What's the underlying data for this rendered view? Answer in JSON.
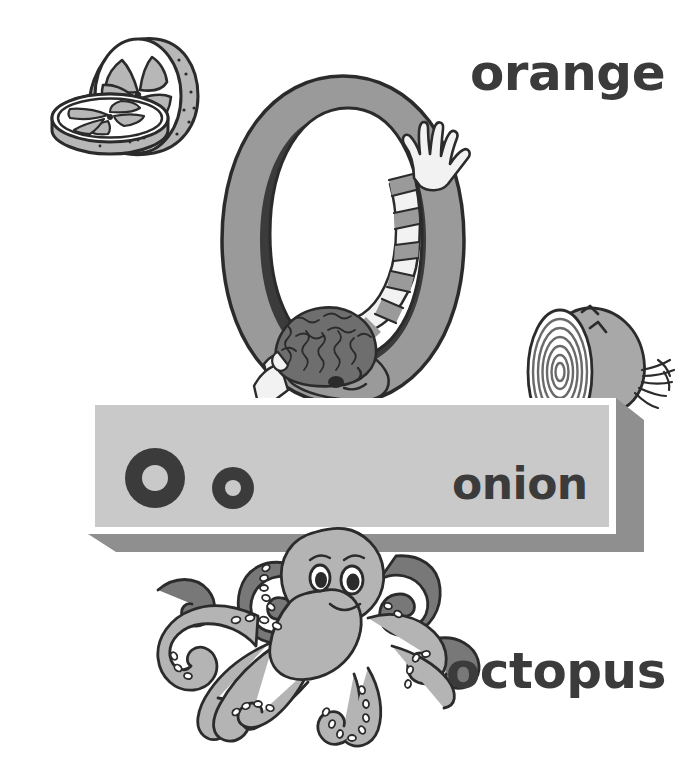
{
  "page": {
    "letter": "O",
    "letter_case_pair": "O o",
    "background_color": "#ffffff",
    "width": 692,
    "height": 766
  },
  "words": {
    "orange": "orange",
    "onion": "onion",
    "octopus": "octopus"
  },
  "banner": {
    "uppercase_letter": "O",
    "lowercase_letter": "o",
    "face_color": "#c9c9c9",
    "border_color": "#ffffff",
    "bevel_color": "#8f8f8f",
    "label": "onion"
  },
  "illustrations": [
    {
      "name": "orange-illustration",
      "subject": "orange",
      "description": "Half of an orange standing upright behind a single round orange slice lying in front, showing segments and rind",
      "fill_light": "#ffffff",
      "fill_mid": "#b7b7b7",
      "outline": "#2b2b2b"
    },
    {
      "name": "big-letter-o-illustration",
      "subject": "letter O with child",
      "description": "Large gray capital letter O with a curly-haired child leaning on the bottom, one striped sleeved arm reaching up over the top right of the O",
      "fill_letter": "#9a9a9a",
      "fill_shadow": "#3b3b3b",
      "outline": "#2b2b2b"
    },
    {
      "name": "onion-illustration",
      "subject": "onion",
      "description": "A halved onion showing concentric rings on the cut face with root fibres at the right",
      "fill_light": "#ffffff",
      "fill_mid": "#a8a8a8",
      "outline": "#2b2b2b"
    },
    {
      "name": "octopus-illustration",
      "subject": "octopus",
      "description": "A smiling cartoon octopus with eight tentacles and rows of suckers, lighter front tentacles and darker rear tentacles",
      "fill_light": "#b4b4b4",
      "fill_dark": "#787878",
      "outline": "#2b2b2b"
    }
  ],
  "colors": {
    "text": "#3b3b3b",
    "outline": "#2b2b2b",
    "gray_light": "#c9c9c9",
    "gray_mid": "#9a9a9a",
    "gray_dark": "#787878"
  }
}
